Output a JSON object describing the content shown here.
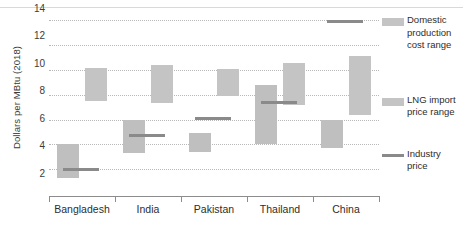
{
  "chart_data": {
    "type": "bar",
    "title": "",
    "xlabel": "",
    "ylabel": "Dollars per MBtu (2018)",
    "ylim": [
      0,
      15
    ],
    "yticks": [
      2,
      4,
      6,
      8,
      10,
      12,
      14
    ],
    "grid": true,
    "legend_position": "right",
    "categories": [
      "Bangladesh",
      "India",
      "Pakistan",
      "Thailand",
      "China"
    ],
    "series": [
      {
        "name": "Domestic production cost range",
        "type": "range-bar",
        "low": [
          1.3,
          3.3,
          3.4,
          4.0,
          3.7
        ],
        "high": [
          4.0,
          6.0,
          4.9,
          8.8,
          6.0
        ]
      },
      {
        "name": "LNG import price range",
        "type": "range-bar",
        "low": [
          7.5,
          7.3,
          7.9,
          7.2,
          6.4
        ],
        "high": [
          10.2,
          10.4,
          10.1,
          10.6,
          11.1
        ]
      },
      {
        "name": "Industry price",
        "type": "marker-line",
        "values": [
          2.0,
          4.7,
          6.1,
          7.4,
          13.9
        ]
      }
    ]
  },
  "axis": {
    "y_title": "Dollars per MBtu (2018)",
    "y_ticks": [
      "14",
      "12",
      "10",
      "8",
      "6",
      "4",
      "2"
    ],
    "x_labels": [
      "Bangladesh",
      "India",
      "Pakistan",
      "Thailand",
      "China"
    ]
  },
  "legend": {
    "items": [
      {
        "label": "Domestic production cost range",
        "swatch": "bar",
        "color": "#c4c4c4"
      },
      {
        "label": "LNG import price range",
        "swatch": "bar",
        "color": "#c4c4c4"
      },
      {
        "label": "Industry price",
        "swatch": "line",
        "color": "#8a8a8a"
      }
    ]
  },
  "colors": {
    "domestic_bar": "#bfbfbf",
    "lng_bar": "#c4c4c4",
    "industry_line": "#8a8a8a",
    "gridline": "#b8b8b8",
    "axis": "#8c8c8c"
  }
}
